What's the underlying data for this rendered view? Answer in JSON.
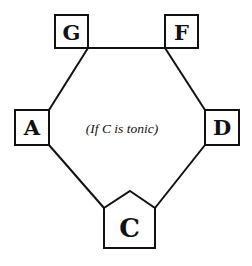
{
  "diagram": {
    "caption": "(If C is tonic)",
    "nodes": [
      {
        "id": "G",
        "label": "G",
        "shape": "square"
      },
      {
        "id": "F",
        "label": "F",
        "shape": "square"
      },
      {
        "id": "A",
        "label": "A",
        "shape": "square"
      },
      {
        "id": "D",
        "label": "D",
        "shape": "square"
      },
      {
        "id": "C",
        "label": "C",
        "shape": "pentagon"
      }
    ],
    "edges": [
      {
        "from": "G",
        "to": "F"
      },
      {
        "from": "G",
        "to": "A"
      },
      {
        "from": "F",
        "to": "D"
      },
      {
        "from": "A",
        "to": "C"
      },
      {
        "from": "D",
        "to": "C"
      }
    ],
    "colors": {
      "stroke": "#111111",
      "background": "#ffffff"
    }
  }
}
